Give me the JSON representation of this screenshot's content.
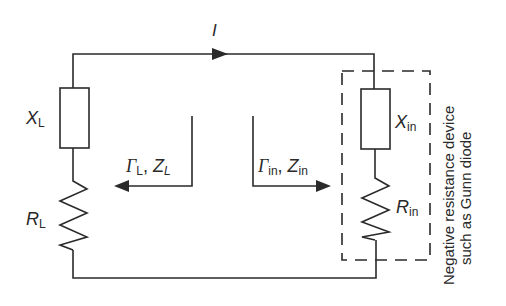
{
  "diagram": {
    "current_label": "I",
    "load": {
      "reactance_symbol": "X",
      "reactance_sub": "L",
      "resistance_symbol": "R",
      "resistance_sub": "L",
      "gamma_symbol": "Γ",
      "gamma_sub": "L",
      "separator": ",",
      "z_symbol": "Z",
      "z_sub": "L"
    },
    "device": {
      "reactance_symbol": "X",
      "reactance_sub": "in",
      "resistance_symbol": "R",
      "resistance_sub": "in",
      "gamma_symbol": "Γ",
      "gamma_sub": "in",
      "separator": ",",
      "z_symbol": "Z",
      "z_sub": "in"
    },
    "device_caption_line1": "Negative resistance device",
    "device_caption_line2": "such as Gunn diode",
    "colors": {
      "line": "#2a2a2a",
      "background": "#ffffff"
    }
  }
}
